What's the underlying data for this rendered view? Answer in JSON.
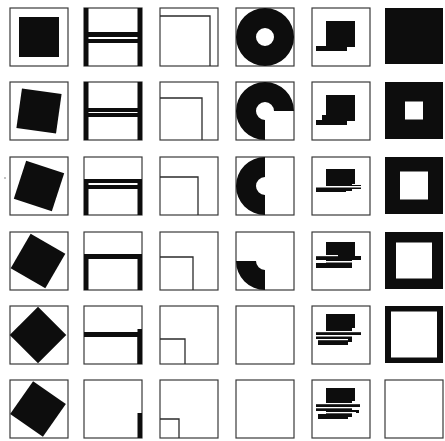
{
  "figure": {
    "title": "",
    "rows": 6,
    "cols": 6,
    "cell_size": 58,
    "col_x": [
      10,
      84,
      160,
      236,
      312,
      385
    ],
    "row_y": [
      8,
      82,
      157,
      232,
      306,
      380
    ],
    "colors": {
      "ink": "#0d0d0d",
      "frame": "#3a3a3a",
      "background": "#ffffff"
    }
  },
  "columns": [
    {
      "name": "rotating-square",
      "description": "Black square rotating progressively inside frame",
      "rotations_deg": [
        0,
        8,
        18,
        30,
        45,
        35
      ],
      "square_size": 40
    },
    {
      "name": "dissolving-h-figure",
      "description": "Thick H-shaped frame progressively losing bars",
      "stages": [
        [
          "left-bar-full",
          "right-bar-full",
          "upper-crossbar",
          "lower-crossbar"
        ],
        [
          "left-bar-full",
          "right-bar-full",
          "upper-crossbar-short",
          "lower-crossbar"
        ],
        [
          "left-bar-lower",
          "right-bar-lower",
          "crossbar-upper",
          "crossbar-lower"
        ],
        [
          "left-bar-lower",
          "right-bar-lower",
          "crossbar"
        ],
        [
          "right-bar-lower",
          "crossbar"
        ],
        [
          "right-bar-stub"
        ]
      ]
    },
    {
      "name": "shrinking-nested-square",
      "description": "Inner square outline anchored bottom-left, shrinking",
      "inner_sizes": [
        50,
        42,
        38,
        33,
        25,
        19
      ]
    },
    {
      "name": "disappearing-annulus",
      "description": "Black ring losing quadrants until empty",
      "quadrants": [
        [
          "tl",
          "tr",
          "bl",
          "br"
        ],
        [
          "tl",
          "tr",
          "bl"
        ],
        [
          "tl",
          "bl"
        ],
        [
          "bl"
        ],
        [],
        []
      ],
      "outer_radius": 29,
      "inner_radius": 9
    },
    {
      "name": "shifting-stepped-block",
      "description": "Black block with horizontal bars multiplying",
      "bar_counts": [
        1,
        1,
        2,
        2,
        3,
        3
      ]
    },
    {
      "name": "opening-square",
      "description": "Solid black square with growing white center",
      "hole_sizes": [
        0,
        18,
        28,
        36,
        46,
        58
      ]
    }
  ]
}
